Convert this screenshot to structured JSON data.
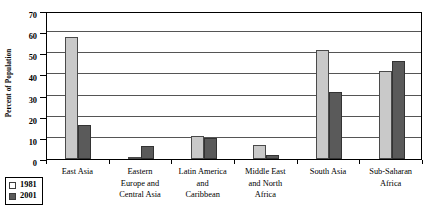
{
  "chart_data": {
    "type": "bar",
    "title": "",
    "xlabel": "",
    "ylabel": "Percent of Population",
    "ylim": [
      0,
      70
    ],
    "yticks": [
      0,
      10,
      20,
      30,
      40,
      50,
      60,
      70
    ],
    "grid": true,
    "legend_position": "bottom-left-outside",
    "categories": [
      "East Asia",
      "Eastern\nEurope and\nCentral Asia",
      "Latin America\nand\nCaribbean",
      "Middle East\nand North\nAfrica",
      "South Asia",
      "Sub-Saharan\nAfrica"
    ],
    "series": [
      {
        "name": "1981",
        "color": "#c9c9c9",
        "values": [
          57.7,
          1.0,
          10.8,
          6.5,
          51.5,
          41.6
        ]
      },
      {
        "name": "2001",
        "color": "#5a5a5a",
        "values": [
          16.0,
          6.0,
          9.9,
          2.0,
          31.9,
          46.4
        ]
      }
    ]
  },
  "legend": {
    "entries": [
      {
        "label": "1981"
      },
      {
        "label": "2001"
      }
    ]
  },
  "axis": {
    "y_title": "Percent of Population"
  }
}
